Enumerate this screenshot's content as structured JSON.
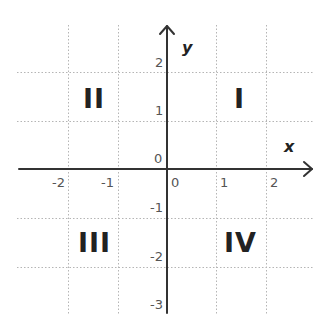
{
  "diagram": {
    "type": "cartesian-coordinate-plane",
    "axes": {
      "x_label": "x",
      "y_label": "y",
      "origin_label_x": "0",
      "origin_label_y": "0"
    },
    "x_ticks": [
      "-2",
      "-1",
      "1",
      "2"
    ],
    "y_ticks": [
      "2",
      "1",
      "-1",
      "-2",
      "-3"
    ],
    "quadrants": {
      "q1": "I",
      "q2": "II",
      "q3": "III",
      "q4": "IV"
    },
    "colors": {
      "axis": "#333333",
      "grid": "#b5b5b5",
      "tick_label": "#555555",
      "quadrant_label": "#222222"
    }
  }
}
